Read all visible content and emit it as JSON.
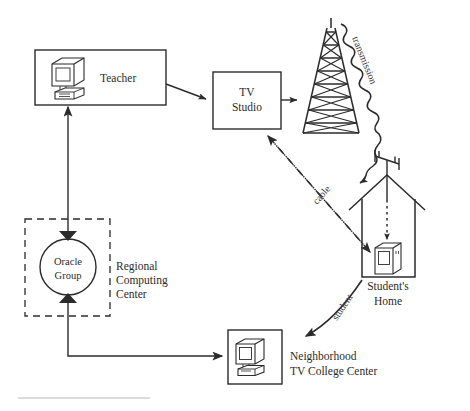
{
  "diagram": {
    "ink_color": "#2b2b2b",
    "background": "#ffffff",
    "nodes": {
      "teacher": {
        "label": "Teacher",
        "icon": "desktop-computer-icon"
      },
      "tv_studio": {
        "label_line1": "TV",
        "label_line2": "Studio"
      },
      "tower": {
        "icon": "broadcast-tower-icon"
      },
      "oracle_group": {
        "label_line1": "Oracle",
        "label_line2": "Group"
      },
      "regional_center": {
        "label_line1": "Regional",
        "label_line2": "Computing",
        "label_line3": "Center"
      },
      "students_home": {
        "label_line1": "Student's",
        "label_line2": "Home",
        "icon": "television-set-icon",
        "antenna": "rooftop-antenna-icon"
      },
      "neighborhood_center": {
        "label_line1": "Neighborhood",
        "label_line2": "TV College Center",
        "icon": "desktop-computer-icon"
      }
    },
    "edges": {
      "transmission": {
        "label": "transmission",
        "style": "wavy-arrow"
      },
      "cable": {
        "label": "cable",
        "style": "dash-dot-double-arrow"
      },
      "student": {
        "label": "student",
        "style": "curved-arrow"
      },
      "teacher_to_studio": {
        "label": "",
        "style": "solid-arrow"
      },
      "studio_to_tower": {
        "label": "",
        "style": "solid-arrow"
      },
      "oracle_to_teacher": {
        "label": "",
        "style": "solid-arrow"
      },
      "oracle_to_neighborhood": {
        "label": "",
        "style": "solid-elbow-arrow"
      },
      "antenna_to_tv": {
        "label": "",
        "style": "dotted-arrow"
      }
    }
  }
}
